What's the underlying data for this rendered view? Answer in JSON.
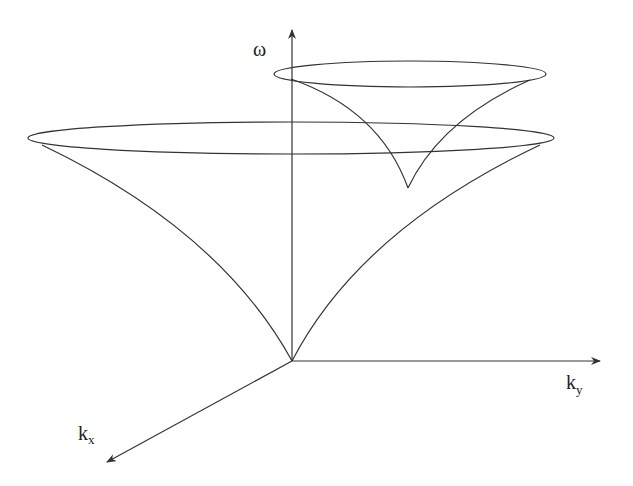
{
  "diagram": {
    "type": "3d-dispersion-cones",
    "stroke_color": "#333333",
    "background": "#ffffff",
    "axes": {
      "omega": {
        "label": "ω"
      },
      "ky": {
        "label": "k",
        "subscript": "y"
      },
      "kx": {
        "label": "k",
        "subscript": "x"
      }
    },
    "shapes": [
      {
        "name": "large-cone",
        "description": "Cone with cusp at origin, opening upward, elliptical rim"
      },
      {
        "name": "small-cone",
        "description": "Smaller displaced cone with cusp above the ky axis, elliptical rim"
      }
    ]
  }
}
